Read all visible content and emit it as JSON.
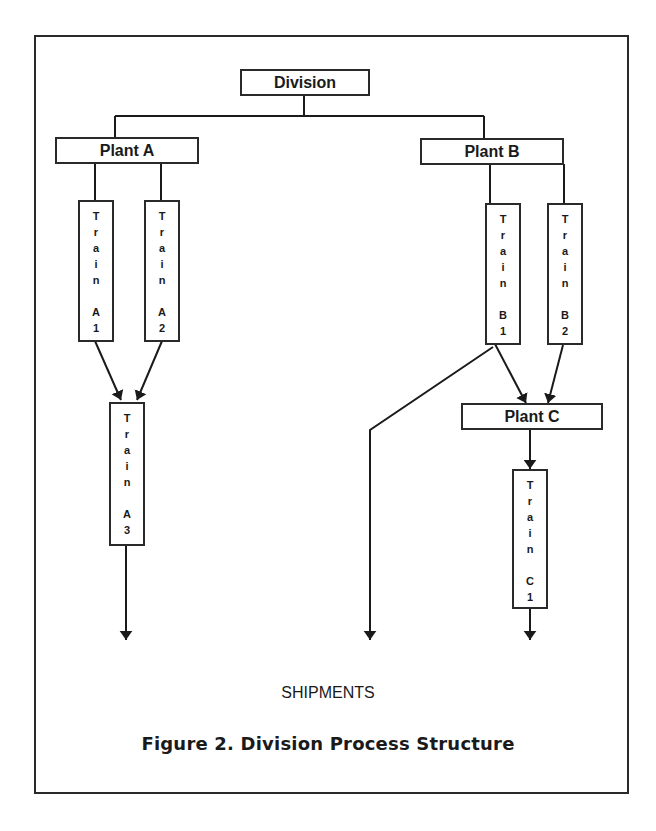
{
  "diagram": {
    "type": "process-structure-tree",
    "nodes": {
      "division": "Division",
      "plant_a": "Plant A",
      "plant_b": "Plant B",
      "plant_c": "Plant C",
      "train_a1": {
        "word": "Train",
        "id": "A1",
        "letters": [
          "T",
          "r",
          "a",
          "i",
          "n"
        ],
        "code": [
          "A",
          "1"
        ]
      },
      "train_a2": {
        "word": "Train",
        "id": "A2",
        "letters": [
          "T",
          "r",
          "a",
          "i",
          "n"
        ],
        "code": [
          "A",
          "2"
        ]
      },
      "train_a3": {
        "word": "Train",
        "id": "A3",
        "letters": [
          "T",
          "r",
          "a",
          "i",
          "n"
        ],
        "code": [
          "A",
          "3"
        ]
      },
      "train_b1": {
        "word": "Train",
        "id": "B1",
        "letters": [
          "T",
          "r",
          "a",
          "i",
          "n"
        ],
        "code": [
          "B",
          "1"
        ]
      },
      "train_b2": {
        "word": "Train",
        "id": "B2",
        "letters": [
          "T",
          "r",
          "a",
          "i",
          "n"
        ],
        "code": [
          "B",
          "2"
        ]
      },
      "train_c1": {
        "word": "Train",
        "id": "C1",
        "letters": [
          "T",
          "r",
          "a",
          "i",
          "n"
        ],
        "code": [
          "C",
          "1"
        ]
      }
    },
    "edges": [
      [
        "Division",
        "Plant A"
      ],
      [
        "Division",
        "Plant B"
      ],
      [
        "Plant A",
        "Train A1"
      ],
      [
        "Plant A",
        "Train A2"
      ],
      [
        "Train A1",
        "Train A3"
      ],
      [
        "Train A2",
        "Train A3"
      ],
      [
        "Train A3",
        "SHIPMENTS"
      ],
      [
        "Plant B",
        "Train B1"
      ],
      [
        "Plant B",
        "Train B2"
      ],
      [
        "Train B1",
        "Plant C"
      ],
      [
        "Train B2",
        "Plant C"
      ],
      [
        "Train B1",
        "SHIPMENTS"
      ],
      [
        "Plant C",
        "Train C1"
      ],
      [
        "Train C1",
        "SHIPMENTS"
      ]
    ],
    "sink_label": "SHIPMENTS",
    "caption": "Figure 2. Division Process Structure"
  }
}
